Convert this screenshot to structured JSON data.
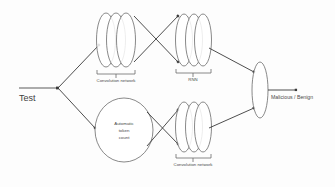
{
  "diagram": {
    "background_color": "#fdfdfd",
    "stroke_color": "#555555",
    "input": {
      "label": "Test"
    },
    "branches": {
      "top": {
        "stage1_label": "Convolution network",
        "stage1_layers": 3,
        "stage2_label": "RNN",
        "stage2_layers": 3
      },
      "bottom": {
        "stage1_label_line1": "Automatic",
        "stage1_label_line2": "token",
        "stage1_label_line3": "count",
        "stage2_label": "Convolution network",
        "stage2_layers": 3
      }
    },
    "output": {
      "label": "Malicious / Benign"
    }
  }
}
